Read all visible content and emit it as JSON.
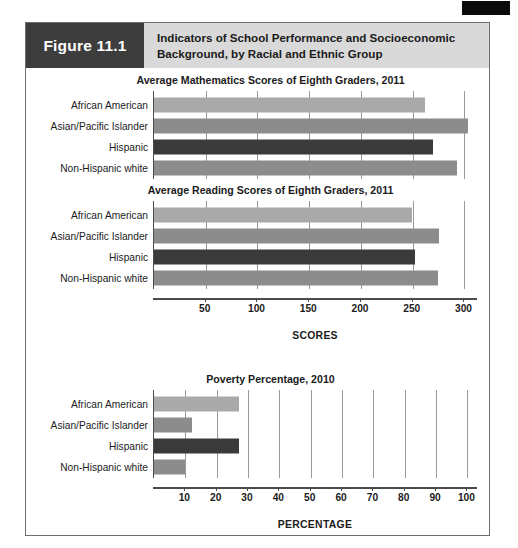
{
  "figure": {
    "number_label": "Figure 11.1",
    "title": "Indicators of School Performance and Socioeconomic Background, by Racial and Ethnic Group"
  },
  "colors": {
    "header_band": "#d9d9d9",
    "number_block": "#3d3d3d",
    "bar_light": "#a9a9a9",
    "bar_medium": "#8c8c8c",
    "bar_dark": "#3a3a3a",
    "gridline": "#9a9a9a",
    "axis": "#4a4a4a",
    "frame": "#6e6e6e"
  },
  "categories": [
    "African American",
    "Asian/Pacific Islander",
    "Hispanic",
    "Non-Hispanic white"
  ],
  "chart_data": [
    {
      "type": "bar",
      "orientation": "horizontal",
      "title": "Average Mathematics Scores of Eighth Graders, 2011",
      "categories": [
        "African American",
        "Asian/Pacific Islander",
        "Hispanic",
        "Non-Hispanic white"
      ],
      "values": [
        262,
        303,
        270,
        293
      ],
      "bar_colors": [
        "#a9a9a9",
        "#8c8c8c",
        "#3a3a3a",
        "#8c8c8c"
      ],
      "xlabel": "SCORES",
      "ylabel": "",
      "xlim": [
        0,
        315
      ],
      "ticks": [
        50,
        100,
        150,
        200,
        250,
        300
      ],
      "tick_labels": [
        "50",
        "100",
        "150",
        "200",
        "250",
        "300"
      ],
      "grid": true,
      "axis_shared_with_next": true
    },
    {
      "type": "bar",
      "orientation": "horizontal",
      "title": "Average Reading Scores of Eighth Graders, 2011",
      "categories": [
        "African American",
        "Asian/Pacific Islander",
        "Hispanic",
        "Non-Hispanic white"
      ],
      "values": [
        249,
        275,
        252,
        274
      ],
      "bar_colors": [
        "#a9a9a9",
        "#8c8c8c",
        "#3a3a3a",
        "#8c8c8c"
      ],
      "xlabel": "SCORES",
      "ylabel": "",
      "xlim": [
        0,
        315
      ],
      "ticks": [
        50,
        100,
        150,
        200,
        250,
        300
      ],
      "tick_labels": [
        "50",
        "100",
        "150",
        "200",
        "250",
        "300"
      ],
      "grid": true
    },
    {
      "type": "bar",
      "orientation": "horizontal",
      "title": "Poverty Percentage, 2010",
      "categories": [
        "African American",
        "Asian/Pacific Islander",
        "Hispanic",
        "Non-Hispanic white"
      ],
      "values": [
        27,
        12,
        27,
        10
      ],
      "bar_colors": [
        "#a9a9a9",
        "#8c8c8c",
        "#3a3a3a",
        "#8c8c8c"
      ],
      "xlabel": "PERCENTAGE",
      "ylabel": "",
      "xlim": [
        0,
        104
      ],
      "ticks": [
        10,
        20,
        30,
        40,
        50,
        60,
        70,
        80,
        90,
        100
      ],
      "tick_labels": [
        "10",
        "20",
        "30",
        "40",
        "50",
        "60",
        "70",
        "80",
        "90",
        "100"
      ],
      "grid": true
    }
  ]
}
